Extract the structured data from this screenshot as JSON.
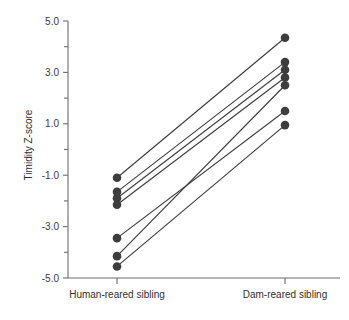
{
  "chart_data": {
    "type": "line",
    "title": "",
    "xlabel": "",
    "ylabel": "Timidity Z-score",
    "categories": [
      "Human-reared sibling",
      "Dam-reared sibling"
    ],
    "ylim": [
      -5.0,
      5.0
    ],
    "ytick_labels": [
      "5.0",
      "3.0",
      "1.0",
      "-1.0",
      "-3.0",
      "-5.0"
    ],
    "ytick_values": [
      5.0,
      3.0,
      1.0,
      -1.0,
      -3.0,
      -5.0
    ],
    "yminor_values": [
      4.0,
      2.0,
      0.0,
      -2.0,
      -4.0
    ],
    "grid": false,
    "legend": "none",
    "marker": "filled-circle",
    "series": [
      {
        "name": "pair-1",
        "values": [
          -1.1,
          4.35
        ]
      },
      {
        "name": "pair-2",
        "values": [
          -1.65,
          3.4
        ]
      },
      {
        "name": "pair-3",
        "values": [
          -1.9,
          3.1
        ]
      },
      {
        "name": "pair-4",
        "values": [
          -2.15,
          2.8
        ]
      },
      {
        "name": "pair-5",
        "values": [
          -3.45,
          1.5
        ]
      },
      {
        "name": "pair-6",
        "values": [
          -4.15,
          2.5
        ]
      },
      {
        "name": "pair-7",
        "values": [
          -4.55,
          0.95
        ]
      }
    ],
    "colors": {
      "marker": "#3d3d3d",
      "line": "#3d3d3d",
      "axis": "#6e6e6e",
      "text": "#2f2f2f",
      "background": "#ffffff"
    }
  }
}
